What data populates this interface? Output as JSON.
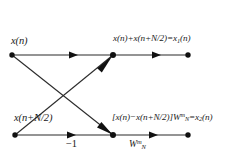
{
  "diagram": {
    "type": "signal-flow-graph",
    "stroke_color": "#2b2b2b",
    "node_color": "#111111",
    "background": "#ffffff",
    "nodes": [
      {
        "id": "in-top",
        "name": "input-node-top",
        "x": 12,
        "y": 55
      },
      {
        "id": "in-bottom",
        "name": "input-node-bottom",
        "x": 15,
        "y": 135
      },
      {
        "id": "mid-top",
        "name": "junction-node-top",
        "x": 113,
        "y": 55
      },
      {
        "id": "mid-bottom",
        "name": "junction-node-bottom",
        "x": 113,
        "y": 135
      },
      {
        "id": "out-top",
        "name": "output-node-top",
        "x": 188,
        "y": 55
      },
      {
        "id": "out-bottom",
        "name": "output-node-bottom",
        "x": 188,
        "y": 135
      }
    ],
    "edges": [
      {
        "id": "e-top-in",
        "name": "edge-top-input",
        "from": "in-top",
        "to": "mid-top",
        "arrow_at": 0.65
      },
      {
        "id": "e-bot-in",
        "name": "edge-bottom-input",
        "from": "in-bottom",
        "to": "mid-bottom",
        "arrow_at": 0.62
      },
      {
        "id": "e-cross-down",
        "name": "edge-cross-descending",
        "from": "in-top",
        "to": "mid-bottom",
        "arrow_at": 1.0
      },
      {
        "id": "e-cross-up",
        "name": "edge-cross-ascending",
        "from": "in-bottom",
        "to": "mid-top",
        "arrow_at": 1.0
      },
      {
        "id": "e-top-out",
        "name": "edge-top-output",
        "from": "mid-top",
        "to": "out-top",
        "arrow_at": 0.62
      },
      {
        "id": "e-bot-out",
        "name": "edge-bottom-output",
        "from": "mid-bottom",
        "to": "out-bottom",
        "arrow_at": 0.58
      }
    ],
    "labels": {
      "input_top": "x(n)",
      "input_bottom": "x(n+N/2)",
      "output_top_prefix": "x(n)+x(n+N/2)=x",
      "output_top_sub": "1",
      "output_top_suffix": "(n)",
      "output_bottom_prefix": "[x(n)−x(n+N/2)]W",
      "output_bottom_sub": "N",
      "output_bottom_sup": "m",
      "output_bottom_mid": "=x",
      "output_bottom_sub2": "2",
      "output_bottom_suffix": "(n)",
      "gain_minus_one": "−1",
      "twiddle_base": "W",
      "twiddle_sub": "N",
      "twiddle_sup": "m"
    }
  }
}
